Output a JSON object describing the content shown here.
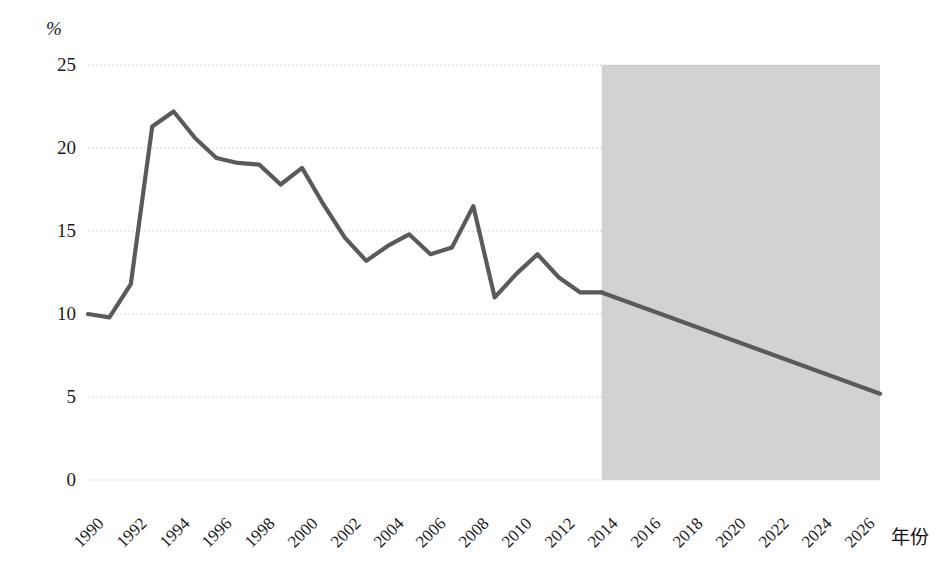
{
  "chart_data": {
    "type": "line",
    "title": "",
    "subtitle": "",
    "xlabel": "年份",
    "ylabel": "%",
    "xlim": [
      1990,
      2027
    ],
    "ylim": [
      0,
      25
    ],
    "grid": true,
    "legend": false,
    "y_ticks": [
      "25",
      "20",
      "15",
      "10",
      "5",
      "0"
    ],
    "y_tick_values": [
      25,
      20,
      15,
      10,
      5,
      0
    ],
    "x_ticks": [
      "1990",
      "1992",
      "1994",
      "1996",
      "1998",
      "2000",
      "2002",
      "2004",
      "2006",
      "2008",
      "2010",
      "2012",
      "2014",
      "2016",
      "2018",
      "2020",
      "2022",
      "2024",
      "2026"
    ],
    "x_tick_values": [
      1990,
      1992,
      1994,
      1996,
      1998,
      2000,
      2002,
      2004,
      2006,
      2008,
      2010,
      2012,
      2014,
      2016,
      2018,
      2020,
      2022,
      2024,
      2026
    ],
    "series": [
      {
        "name": "历史值",
        "kind": "historical",
        "color": "#5a5a5a",
        "x": [
          1990,
          1991,
          1992,
          1993,
          1994,
          1995,
          1996,
          1997,
          1998,
          1999,
          2000,
          2001,
          2002,
          2003,
          2004,
          2005,
          2006,
          2007,
          2008,
          2009,
          2010,
          2011,
          2012,
          2013,
          2014
        ],
        "values": [
          10.0,
          9.8,
          11.8,
          21.3,
          22.2,
          20.6,
          19.4,
          19.1,
          19.0,
          17.8,
          18.8,
          16.6,
          14.6,
          13.2,
          14.1,
          14.8,
          13.6,
          14.0,
          16.5,
          11.0,
          12.4,
          13.6,
          12.2,
          11.3,
          11.3
        ]
      },
      {
        "name": "预测值",
        "kind": "forecast",
        "color": "#5a5a5a",
        "x": [
          2014,
          2027
        ],
        "values": [
          11.3,
          5.2
        ]
      }
    ],
    "shaded_region": {
      "label": "预测区间",
      "x_start": 2014,
      "x_end": 2027,
      "color": "#d2d2d2"
    },
    "colors": {
      "line": "#5a5a5a",
      "shade": "#d2d2d2",
      "grid": "#c8c8c8",
      "text": "#1a1a1a",
      "background": "#ffffff"
    }
  }
}
